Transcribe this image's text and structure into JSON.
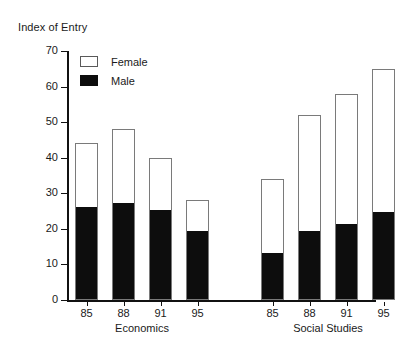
{
  "chart_data": {
    "type": "bar",
    "subtype": "stacked",
    "title": "Index of Entry",
    "xlabel": "",
    "ylabel": "Index of Entry",
    "ylim": [
      0,
      70
    ],
    "ytick_step": 10,
    "yticks": [
      70,
      60,
      50,
      40,
      30,
      20,
      10,
      0
    ],
    "grid": false,
    "legend_position": "top-left-inside",
    "series": [
      {
        "name": "Female",
        "color": "#ffffff",
        "values": [
          18,
          21,
          15,
          9,
          21,
          33,
          37,
          40.5
        ]
      },
      {
        "name": "Male",
        "color": "#000000",
        "values": [
          26,
          27,
          25,
          19,
          13,
          19,
          21,
          24.5
        ]
      }
    ],
    "totals": [
      44,
      48,
      40,
      28,
      34,
      52,
      58,
      65
    ],
    "categories": [
      "85",
      "88",
      "91",
      "95",
      "85",
      "88",
      "91",
      "95"
    ],
    "groups": [
      {
        "label": "Economics",
        "categories": [
          "85",
          "88",
          "91",
          "95"
        ],
        "totals": [
          44,
          48,
          40,
          28
        ],
        "male": [
          26,
          27,
          25,
          19
        ],
        "female": [
          18,
          21,
          15,
          9
        ]
      },
      {
        "label": "Social Studies",
        "categories": [
          "85",
          "88",
          "91",
          "95"
        ],
        "totals": [
          34,
          52,
          58,
          65
        ],
        "male": [
          13,
          19,
          21,
          24.5
        ],
        "female": [
          21,
          33,
          37,
          40.5
        ]
      }
    ]
  },
  "legend": {
    "items": [
      {
        "label": "Female",
        "swatch": "white"
      },
      {
        "label": "Male",
        "swatch": "black"
      }
    ]
  }
}
